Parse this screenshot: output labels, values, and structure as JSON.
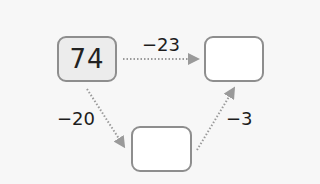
{
  "diagram": {
    "start": {
      "value": "74"
    },
    "top_right": {
      "value": ""
    },
    "bottom": {
      "value": ""
    },
    "operations": {
      "start_to_top_right": "−23",
      "start_to_bottom": "−20",
      "bottom_to_top_right": "−3"
    }
  },
  "colors": {
    "start_fill": "#ececec",
    "box_fill": "#ffffff",
    "border": "#8e8e8e",
    "arrow": "#9a9a9a"
  }
}
